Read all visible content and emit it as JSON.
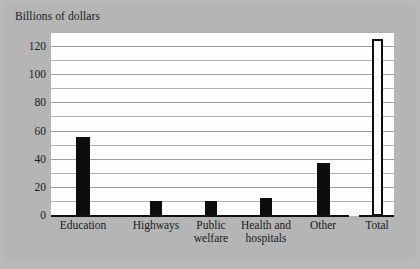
{
  "chart_data": {
    "type": "bar",
    "title": "",
    "ylabel": "Billions of dollars",
    "xlabel": "",
    "ylim": [
      0,
      130
    ],
    "yticks": [
      0,
      20,
      40,
      60,
      80,
      100,
      120
    ],
    "gridline_interval": 10,
    "grid": true,
    "legend": "none",
    "categories": [
      "Education",
      "Highways",
      "Public welfare",
      "Health and hospitals",
      "Other",
      "Total"
    ],
    "values": [
      56,
      11,
      11,
      13,
      38,
      126
    ],
    "bar_styles": [
      "filled",
      "filled",
      "filled",
      "filled",
      "filled",
      "outlined"
    ],
    "annotations": [
      "Total bar is separated from the component categories by a break in the baseline",
      "Total bar is drawn as a hollow outlined rectangle"
    ]
  },
  "figure": {
    "background_color": "#b5b5b5",
    "plot_background_color": "#fdfdfd",
    "bar_color": "#0d0d0d",
    "gridline_color": "#b2b2b2",
    "axis_color": "#111111"
  },
  "y_axis": {
    "title": "Billions of dollars",
    "ticks": [
      {
        "label": "120",
        "value": 120
      },
      {
        "label": "100",
        "value": 100
      },
      {
        "label": "80",
        "value": 80
      },
      {
        "label": "60",
        "value": 60
      },
      {
        "label": "40",
        "value": 40
      },
      {
        "label": "20",
        "value": 20
      },
      {
        "label": "0",
        "value": 0
      }
    ]
  },
  "x_axis": {
    "categories": [
      {
        "label": "Education",
        "value": 56,
        "style": "filled"
      },
      {
        "label": "Highways",
        "value": 11,
        "style": "filled"
      },
      {
        "label": "Public welfare",
        "value": 11,
        "style": "filled"
      },
      {
        "label": "Health and hospitals",
        "value": 13,
        "style": "filled"
      },
      {
        "label": "Other",
        "value": 38,
        "style": "filled"
      },
      {
        "label": "Total",
        "value": 126,
        "style": "outlined"
      }
    ]
  }
}
